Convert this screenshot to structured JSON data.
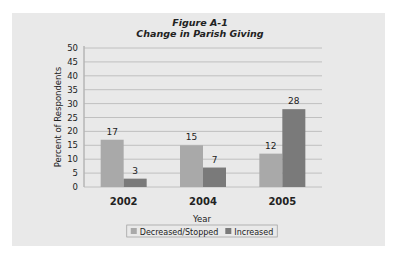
{
  "chart_data": {
    "type": "bar",
    "title": "Figure A-1",
    "subtitle": "Change in Parish Giving",
    "xlabel": "Year",
    "ylabel": "Percent of Respondents",
    "categories": [
      "2002",
      "2004",
      "2005"
    ],
    "series": [
      {
        "name": "Decreased/Stopped",
        "values": [
          17,
          15,
          12
        ],
        "color": "#a9a9a9"
      },
      {
        "name": "Increased",
        "values": [
          3,
          7,
          28
        ],
        "color": "#7a7a7a"
      }
    ],
    "ylim": [
      0,
      50
    ],
    "yticks": [
      0,
      5,
      10,
      15,
      20,
      25,
      30,
      35,
      40,
      45,
      50
    ],
    "grid": true,
    "legend": "bottom-center",
    "colors": {
      "panel": "#e9e9e9",
      "grid": "#b5b5b5",
      "axis": "#888888"
    }
  }
}
